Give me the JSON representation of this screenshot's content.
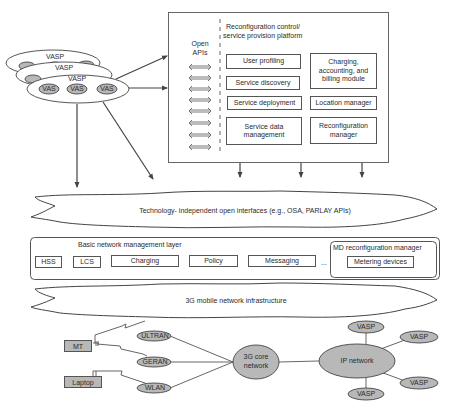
{
  "vasp_stack": {
    "vasp_labels": [
      "VASP",
      "VASP",
      "VASP"
    ],
    "vas_labels": [
      "VAS",
      "VAS",
      "VAS"
    ]
  },
  "platform": {
    "title_line1": "Reconfiguration control/",
    "title_line2": "service provision platform",
    "open_apis_line1": "Open",
    "open_apis_line2": "APIs",
    "open_api_arrow_count": 8,
    "modules": {
      "user_profiling": "User profiling",
      "service_discovery": "Service discovery",
      "service_deployment": "Service deployment",
      "service_data_management_line1": "Service data",
      "service_data_management_line2": "management",
      "charging_line1": "Charging,",
      "charging_line2": "accounting, and",
      "charging_line3": "billing module",
      "location_manager": "Location manager",
      "reconfiguration_manager_line1": "Reconfiguration",
      "reconfiguration_manager_line2": "manager"
    }
  },
  "open_interfaces_cloud": {
    "label": "Technology- independent open interfaces (e.g., OSA, PARLAY APIs)"
  },
  "management_layer": {
    "title": "Basic network management layer",
    "items": [
      "HSS",
      "LCS",
      "Charging",
      "Policy",
      "Messaging"
    ],
    "ellipsis": "...",
    "md_manager": {
      "title": "MD reconfiguration manager",
      "item": "Metering devices"
    }
  },
  "infrastructure_cloud": {
    "label": "3G mobile network infrastructure"
  },
  "bottom_network": {
    "devices": {
      "mt": "MT",
      "laptop": "Laptop"
    },
    "access_networks": [
      "ULTRAN",
      "GERAN",
      "WLAN"
    ],
    "core_line1": "3G core",
    "core_line2": "network",
    "ip_network": "IP network",
    "vasps": [
      "VASP",
      "VASP",
      "VASP",
      "VASP"
    ]
  },
  "colors": {
    "line": "#555555",
    "oval_fill": "#b8b8b8",
    "box_fill": "#ffffff",
    "text": "#2b2b2b"
  }
}
